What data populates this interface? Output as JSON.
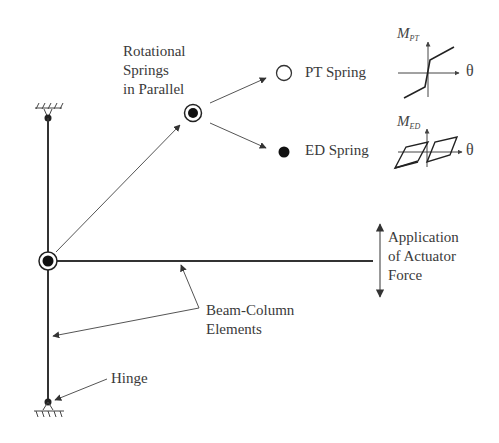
{
  "labels": {
    "rotational_springs": "Rotational\nSprings\nin Parallel",
    "pt_spring": "PT Spring",
    "ed_spring": "ED Spring",
    "actuator": "Application\nof Actuator\nForce",
    "beam_column": "Beam-Column\nElements",
    "hinge": "Hinge"
  },
  "graphs": {
    "pt": {
      "y_axis_main": "M",
      "y_axis_sub": "PT",
      "x_axis": "θ"
    },
    "ed": {
      "y_axis_main": "M",
      "y_axis_sub": "ED",
      "x_axis": "θ"
    }
  },
  "colors": {
    "line": "#333333",
    "arrow": "#555555",
    "background": "#ffffff"
  }
}
